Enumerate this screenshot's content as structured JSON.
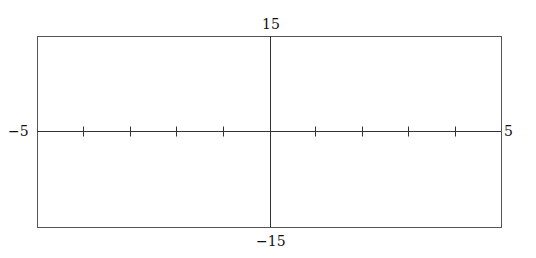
{
  "chart_data": {
    "type": "line",
    "title": "",
    "xlabel": "",
    "ylabel": "",
    "xlim": [
      -5,
      5
    ],
    "ylim": [
      -15,
      15
    ],
    "x_tick_step": 1,
    "grid": false,
    "series": [],
    "axis_labels": {
      "x_min": "−5",
      "x_max": "5",
      "y_max": "15",
      "y_min": "−15"
    }
  },
  "colors": {
    "axis": "#333333",
    "frame": "#555555",
    "background": "#ffffff"
  }
}
